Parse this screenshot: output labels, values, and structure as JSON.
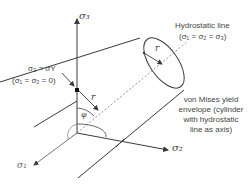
{
  "axes": {
    "sigma3": "σ₃",
    "sigma2": "σ₂",
    "sigma1": "σ₁"
  },
  "annotations": {
    "yield_point_line1": "σ₃ = σY",
    "yield_point_line2": "(σ₁ = σ₂ = 0)",
    "hydrostatic_line1": "Hydrostatic line",
    "hydrostatic_line2": "(σ₁ = σ₂ = σ₃)",
    "radius_top": "r",
    "radius_mid": "r",
    "angle": "φ",
    "envelope_line1": "von Mises yield",
    "envelope_line2": "envelope (cylinder",
    "envelope_line3": "with hydrostatic",
    "envelope_line4": "line as axis)"
  },
  "colors": {
    "line": "#3a3a3a",
    "text": "#444444",
    "dashed": "#777777"
  }
}
